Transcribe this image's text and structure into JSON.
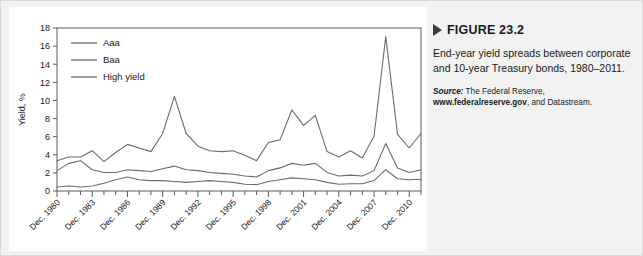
{
  "figure": {
    "marker_icon": "right-triangle-icon",
    "title": "FIGURE 23.2",
    "caption": "End-year yield spreads between corporate and 10-year Treasury bonds, 1980–2011.",
    "source_label": "Source:",
    "source_text_1": " The Federal Reserve, ",
    "source_url": "www.federalreserve.gov",
    "source_text_2": ", and Datastream."
  },
  "chart_data": {
    "type": "line",
    "title": "",
    "xlabel": "",
    "ylabel": "Yield, %",
    "ylim": [
      0,
      18
    ],
    "ytick_step": 2,
    "yticks": [
      0,
      2,
      4,
      6,
      8,
      10,
      12,
      14,
      16,
      18
    ],
    "grid": false,
    "legend_position": "top-left",
    "x": [
      1980,
      1981,
      1982,
      1983,
      1984,
      1985,
      1986,
      1987,
      1988,
      1989,
      1990,
      1991,
      1992,
      1993,
      1994,
      1995,
      1996,
      1997,
      1998,
      1999,
      2000,
      2001,
      2002,
      2003,
      2004,
      2005,
      2006,
      2007,
      2008,
      2009,
      2010,
      2011
    ],
    "xtick_labels": [
      "Dec. 1980",
      "Dec. 1983",
      "Dec. 1986",
      "Dec. 1989",
      "Dec. 1992",
      "Dec. 1995",
      "Dec. 1998",
      "Dec. 2001",
      "Dec. 2004",
      "Dec. 2007",
      "Dec. 2010"
    ],
    "xtick_values": [
      1980,
      1983,
      1986,
      1989,
      1992,
      1995,
      1998,
      2001,
      2004,
      2007,
      2010
    ],
    "series": [
      {
        "name": "Aaa",
        "color": "#6b6b6b",
        "values": [
          0.45,
          0.55,
          0.45,
          0.55,
          0.85,
          1.25,
          1.55,
          1.25,
          1.15,
          1.15,
          1.05,
          0.95,
          1.05,
          1.15,
          1.05,
          0.95,
          0.75,
          0.7,
          1.05,
          1.25,
          1.45,
          1.35,
          1.25,
          0.95,
          0.75,
          0.8,
          0.8,
          1.15,
          2.35,
          1.35,
          1.25,
          1.3
        ]
      },
      {
        "name": "Baa",
        "color": "#6b6b6b",
        "values": [
          2.25,
          3.05,
          3.35,
          2.35,
          2.05,
          2.05,
          2.35,
          2.25,
          2.15,
          2.45,
          2.75,
          2.35,
          2.25,
          2.05,
          1.95,
          1.85,
          1.65,
          1.55,
          2.25,
          2.55,
          3.05,
          2.85,
          3.05,
          2.05,
          1.65,
          1.75,
          1.65,
          2.25,
          5.25,
          2.55,
          2.05,
          2.35
        ]
      },
      {
        "name": "High yield",
        "color": "#6b6b6b",
        "values": [
          3.35,
          3.75,
          3.75,
          4.45,
          3.25,
          4.25,
          5.15,
          4.75,
          4.35,
          6.35,
          10.45,
          6.35,
          4.95,
          4.45,
          4.35,
          4.45,
          3.95,
          3.35,
          5.35,
          5.65,
          8.95,
          7.25,
          8.35,
          4.35,
          3.75,
          4.45,
          3.65,
          6.05,
          17.05,
          6.25,
          4.75,
          6.35
        ]
      }
    ],
    "legend": [
      "Aaa",
      "Baa",
      "High yield"
    ]
  }
}
